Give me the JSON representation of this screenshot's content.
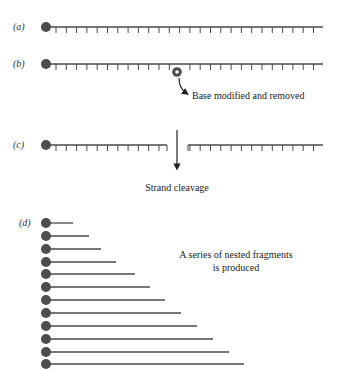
{
  "panels": {
    "a": {
      "label": "(a)"
    },
    "b": {
      "label": "(b)",
      "annotation": "Base modified and removed"
    },
    "c": {
      "label": "(c)",
      "annotation": "Strand cleavage"
    },
    "d": {
      "label": "(d)",
      "annotation_line1": "A series of nested fragments",
      "annotation_line2": "is produced",
      "fragment_count": 12
    }
  },
  "colors": {
    "ink": "#4a4a4a",
    "ball": "#4d4d4d",
    "text": "#222222"
  },
  "geometry": {
    "ball_x": 46,
    "ball_r": 5,
    "strand_end_x": 323,
    "tick_start_x": 56,
    "tick_spacing": 10.3,
    "tick_len": 6,
    "strand_a_y": 27,
    "strand_b_y": 64,
    "strand_c_y": 145,
    "gap_left_end": 167,
    "gap_right_start": 188,
    "modified_base": {
      "x": 177,
      "y": 72
    },
    "fragments_y": [
      223,
      236,
      249,
      262,
      274,
      287,
      300,
      313,
      326,
      339,
      352,
      364
    ],
    "fragments_end_x": [
      73,
      89,
      101,
      116,
      135,
      150,
      165,
      181,
      197,
      213,
      229,
      244
    ]
  }
}
